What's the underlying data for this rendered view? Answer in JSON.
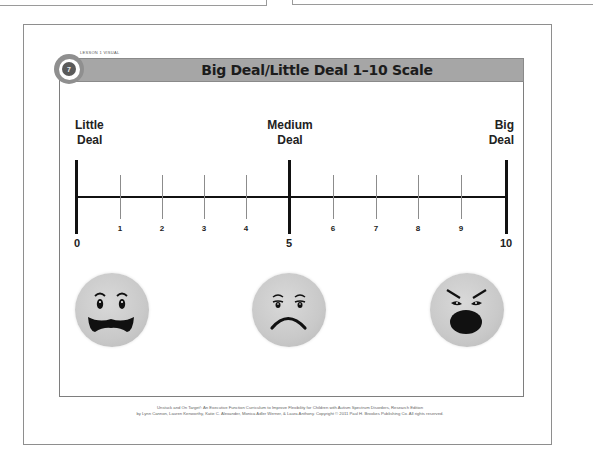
{
  "page": {
    "lesson_label": "LESSON 1 VISUAL",
    "badge_number": "7",
    "title": "Big Deal/Little Deal 1–10 Scale"
  },
  "scale": {
    "labels": {
      "left": [
        "Little",
        "Deal"
      ],
      "middle": [
        "Medium",
        "Deal"
      ],
      "right": [
        "Big",
        "Deal"
      ]
    },
    "major_ticks": [
      "0",
      "5",
      "10"
    ],
    "minor_ticks": [
      "1",
      "2",
      "3",
      "4",
      "6",
      "7",
      "8",
      "9"
    ]
  },
  "faces": [
    {
      "name": "worried-face",
      "position": "little-deal"
    },
    {
      "name": "sad-face",
      "position": "medium-deal"
    },
    {
      "name": "angry-face",
      "position": "big-deal"
    }
  ],
  "footer": {
    "line1": "Unstuck and On Target!: An Executive Function Curriculum to Improve Flexibility for Children with Autism Spectrum Disorders, Research Edition",
    "line2": "by Lynn Cannon, Lauren Kenworthy, Katie C. Alexander, Monica Adler Werner, & Laura Anthony. Copyright © 2011 Paul H. Brookes Publishing Co. All rights reserved."
  }
}
